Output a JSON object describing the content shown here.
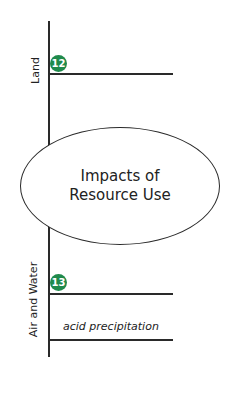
{
  "diagram": {
    "center": {
      "line1": "Impacts of",
      "line2": "Resource Use"
    },
    "branches": [
      {
        "label": "Land",
        "badge": "12",
        "details": []
      },
      {
        "label": "Air and Water",
        "badge": "13",
        "details": [
          "acid precipitation"
        ]
      }
    ],
    "colors": {
      "badge": "#1f8a4c",
      "line": "#2a2a2a"
    }
  }
}
